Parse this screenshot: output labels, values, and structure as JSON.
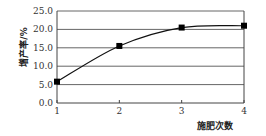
{
  "chart_data": {
    "type": "line",
    "title": "",
    "xlabel": "施肥次数",
    "ylabel": "增产率/%",
    "x": [
      1,
      2,
      3,
      4
    ],
    "x_tick_labels": [
      "1",
      "2",
      "3",
      "4"
    ],
    "y_tick_labels": [
      "0.0",
      "5.0",
      "10.0",
      "15.0",
      "20.0",
      "25.0"
    ],
    "y_ticks": [
      0,
      5,
      10,
      15,
      20,
      25
    ],
    "ylim": [
      0,
      25
    ],
    "xlim": [
      1,
      4
    ],
    "grid": "horizontal",
    "legend": "none",
    "series": [
      {
        "name": "增产率",
        "values": [
          5.8,
          15.5,
          20.5,
          21.0
        ],
        "marker": "square",
        "line": "smooth",
        "color": "#111111"
      }
    ]
  },
  "colors": {
    "gridline": "#555555",
    "axis": "#444444",
    "line": "#111111",
    "marker": "#000000"
  }
}
